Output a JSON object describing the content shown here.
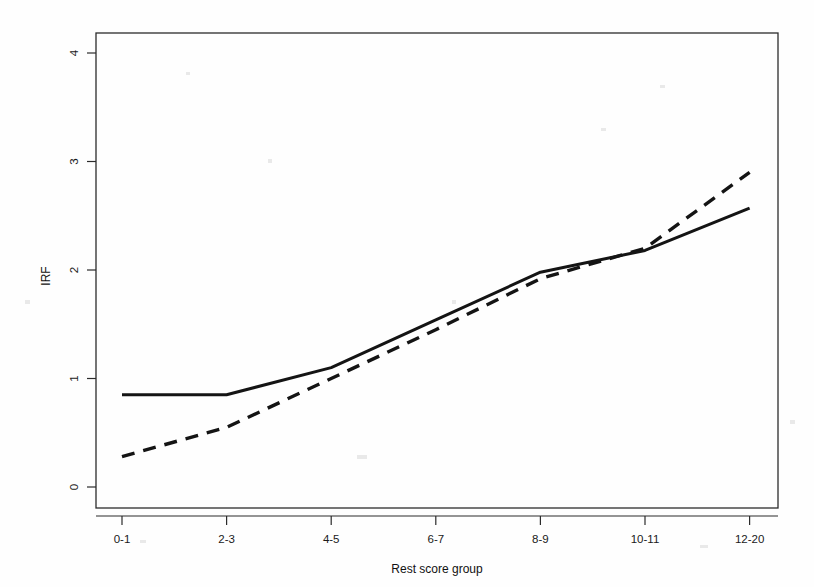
{
  "figure": {
    "background_color": "#fefefe",
    "line_color": "#141414",
    "axis_color": "#2b2b2b"
  },
  "axes": {
    "y_title": "IRF",
    "x_title": "Rest score group",
    "y_ticks": [
      "0",
      "1",
      "2",
      "3",
      "4"
    ],
    "x_ticks": [
      "0-1",
      "2-3",
      "4-5",
      "6-7",
      "8-9",
      "10-11",
      "12-20"
    ]
  },
  "chart_data": {
    "type": "line",
    "title": "",
    "subtitle": "",
    "xlabel": "Rest score group",
    "ylabel": "IRF",
    "categories": [
      "0-1",
      "2-3",
      "4-5",
      "6-7",
      "8-9",
      "10-11",
      "12-20"
    ],
    "series": [
      {
        "name": "solid-curve",
        "style": "solid",
        "color": "#141414",
        "values": [
          0.85,
          0.85,
          1.1,
          1.54,
          1.98,
          2.18,
          2.57
        ]
      },
      {
        "name": "dashed-curve",
        "style": "dashed",
        "color": "#141414",
        "values": [
          0.28,
          0.55,
          1.0,
          1.45,
          1.92,
          2.2,
          2.9
        ]
      }
    ],
    "ylim": [
      -0.22,
      4.25
    ],
    "xlim": [
      0,
      6
    ],
    "y_ticks": [
      0,
      1,
      2,
      3,
      4
    ],
    "grid": false,
    "legend": "none",
    "annotations": []
  },
  "geometry": {
    "plot_left": 96,
    "plot_right": 778,
    "plot_top": 33,
    "plot_bottom": 508,
    "y_zero_px": 487,
    "y_unit_px": 108.5,
    "x_first_px": 122,
    "x_step_px": 104.6
  }
}
